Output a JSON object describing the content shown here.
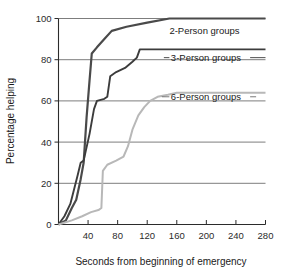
{
  "chart_data": {
    "type": "line",
    "title": "",
    "xlabel": "Seconds from beginning of emergency",
    "ylabel": "Percentage helping",
    "xlim": [
      0,
      280
    ],
    "ylim": [
      0,
      100
    ],
    "xticks": [
      0,
      40,
      80,
      120,
      160,
      200,
      240,
      280
    ],
    "yticks": [
      0,
      20,
      40,
      60,
      80,
      100
    ],
    "xtick_labels": [
      "0",
      "40",
      "80",
      "120",
      "160",
      "200",
      "240",
      "280"
    ],
    "ytick_labels": [
      "0",
      "20",
      "40",
      "60",
      "80",
      "100"
    ],
    "grid": "horizontal",
    "legend_position": "inline-right-of-curve",
    "series": [
      {
        "name": "2-Person groups",
        "color": "#4a4a4a",
        "label": "2-Person groups",
        "label_x": 150,
        "label_y": 94,
        "points": [
          [
            0,
            0
          ],
          [
            10,
            2
          ],
          [
            18,
            8
          ],
          [
            24,
            12
          ],
          [
            30,
            22
          ],
          [
            34,
            30
          ],
          [
            38,
            52
          ],
          [
            42,
            70
          ],
          [
            45,
            83
          ],
          [
            52,
            86
          ],
          [
            62,
            90
          ],
          [
            72,
            94
          ],
          [
            92,
            96
          ],
          [
            120,
            98
          ],
          [
            150,
            100
          ],
          [
            280,
            100
          ]
        ]
      },
      {
        "name": "3-Person groups",
        "color": "#3c3c3c",
        "label": "3-Person groups",
        "label_x": 152,
        "label_y": 81,
        "points": [
          [
            0,
            0
          ],
          [
            8,
            4
          ],
          [
            16,
            10
          ],
          [
            26,
            24
          ],
          [
            30,
            30
          ],
          [
            34,
            31
          ],
          [
            42,
            44
          ],
          [
            48,
            56
          ],
          [
            52,
            60
          ],
          [
            62,
            61
          ],
          [
            66,
            62
          ],
          [
            70,
            72
          ],
          [
            78,
            74
          ],
          [
            90,
            76
          ],
          [
            100,
            79
          ],
          [
            106,
            81
          ],
          [
            110,
            85
          ],
          [
            150,
            85
          ],
          [
            280,
            85
          ]
        ]
      },
      {
        "name": "6-Person groups",
        "color": "#b8b8b8",
        "label": "6-Person groups",
        "label_x": 152,
        "label_y": 62,
        "points": [
          [
            0,
            0
          ],
          [
            18,
            2
          ],
          [
            32,
            4
          ],
          [
            44,
            6
          ],
          [
            54,
            7
          ],
          [
            58,
            8
          ],
          [
            60,
            26
          ],
          [
            66,
            29
          ],
          [
            78,
            31
          ],
          [
            88,
            33
          ],
          [
            94,
            38
          ],
          [
            100,
            46
          ],
          [
            108,
            53
          ],
          [
            116,
            57
          ],
          [
            124,
            60
          ],
          [
            134,
            62
          ],
          [
            148,
            63
          ],
          [
            160,
            64
          ],
          [
            280,
            64
          ]
        ]
      }
    ]
  },
  "axes": {
    "x_title": "Seconds from beginning of emergency",
    "y_title": "Percentage helping"
  },
  "colors": {
    "series_2person": "#4a4a4a",
    "series_3person": "#3c3c3c",
    "series_6person": "#b8b8b8",
    "gridline": "#6e6e6e",
    "axis": "#2b2b2b",
    "background": "#ffffff"
  }
}
